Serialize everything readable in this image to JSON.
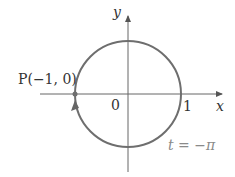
{
  "diagram": {
    "type": "unit-circle-parametric",
    "axes": {
      "x_label": "x",
      "y_label": "y"
    },
    "origin_label": "0",
    "tick_label": "1",
    "point": {
      "label": "P(−1, 0)"
    },
    "parameter_label": "t = −π",
    "colors": {
      "circle": "#6e6e6e",
      "axes": "#555555",
      "text": "#333333",
      "param_text": "#8a8a8a"
    }
  }
}
